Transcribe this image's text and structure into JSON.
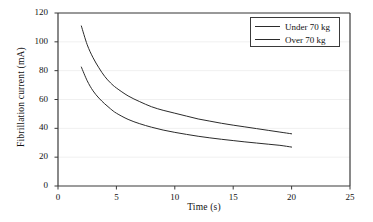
{
  "chart_data": {
    "type": "line",
    "title": "",
    "xlabel": "Time (s)",
    "ylabel": "Fibrillation current (mA)",
    "xlim": [
      0,
      25
    ],
    "ylim": [
      0,
      120
    ],
    "xticks": [
      "0",
      "5",
      "10",
      "15",
      "20",
      "25"
    ],
    "xtick_values": [
      0,
      5,
      10,
      15,
      20,
      25
    ],
    "yticks": [
      "0",
      "20",
      "40",
      "60",
      "80",
      "100",
      "120"
    ],
    "ytick_values": [
      0,
      20,
      40,
      60,
      80,
      100,
      120
    ],
    "grid": true,
    "grid_axis": "y",
    "legend_position": "upper right",
    "line_color": "#2b2b2b",
    "background_color": "#ffffff",
    "grid_color": "#f0f0f0",
    "axis_color": "#3a3a3a",
    "x": [
      2,
      2.5,
      3,
      3.5,
      4,
      4.5,
      5,
      6,
      7,
      8,
      9,
      10,
      11,
      12,
      13,
      14,
      15,
      16,
      17,
      18,
      19,
      20
    ],
    "series": [
      {
        "name": "Under 70 kg",
        "values": [
          111,
          98,
          89,
          82,
          76,
          71.5,
          68,
          62.5,
          58.5,
          55,
          52.5,
          50.5,
          48.5,
          46.5,
          45,
          43.5,
          42.2,
          41,
          39.8,
          38.6,
          37.4,
          36.2
        ]
      },
      {
        "name": "Over 70 kg",
        "values": [
          82.5,
          73,
          66,
          61,
          57,
          53.5,
          50.5,
          46.2,
          43.2,
          40.8,
          38.8,
          37.2,
          35.8,
          34.5,
          33.4,
          32.4,
          31.5,
          30.6,
          29.8,
          29,
          28.2,
          27
        ]
      }
    ],
    "legend": [
      {
        "label": "Under 70 kg"
      },
      {
        "label": "Over 70 kg"
      }
    ]
  },
  "plot_geometry": {
    "left": 58,
    "right": 350,
    "top": 13,
    "bottom": 186
  }
}
